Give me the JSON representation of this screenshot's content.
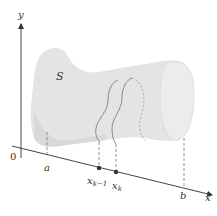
{
  "figure": {
    "colors": {
      "solid_fill": "#e4e4e4",
      "solid_shade": "#d6d6d6",
      "end_cap": "#ececec",
      "slice_outline": "#8a8a8a",
      "axis": "#444444",
      "dashed": "#777777"
    },
    "labels": {
      "y_axis": "y",
      "x_axis": "x",
      "origin": "0",
      "solid": "S",
      "a": "a",
      "x_k_minus_1_base": "x",
      "x_k_minus_1_sub": "k−1",
      "x_k_base": "x",
      "x_k_sub": "k",
      "b": "b"
    }
  }
}
